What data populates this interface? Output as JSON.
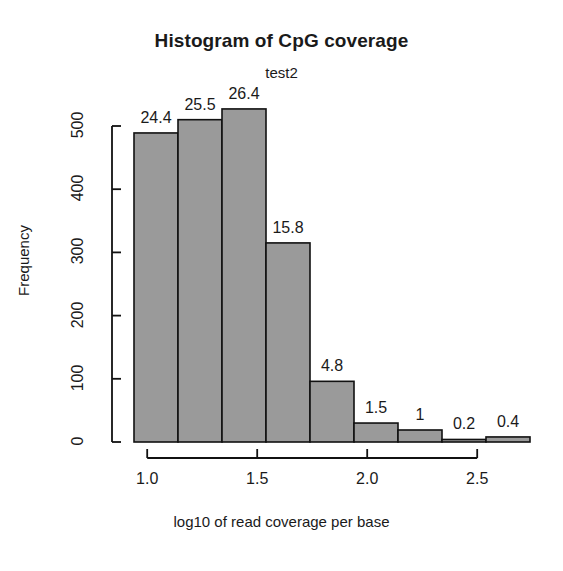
{
  "chart_data": {
    "type": "bar",
    "title": "Histogram of CpG coverage",
    "subtitle": "test2",
    "xlabel": "log10 of read coverage per base",
    "ylabel": "Frequency",
    "xlim": [
      0.94,
      2.74
    ],
    "ylim": [
      0,
      530
    ],
    "grid": false,
    "legend": "none",
    "bin_width": 0.2,
    "x_ticks": [
      "1.0",
      "1.5",
      "2.0",
      "2.5"
    ],
    "x_tick_values": [
      1.0,
      1.5,
      2.0,
      2.5
    ],
    "y_ticks": [
      "0",
      "100",
      "200",
      "300",
      "400",
      "500"
    ],
    "y_tick_values": [
      0,
      100,
      200,
      300,
      400,
      500
    ],
    "bar_fill": "#9a9a9a",
    "bar_stroke": "#111111",
    "bins": [
      {
        "x_start": 0.94,
        "x_end": 1.14,
        "value": 489,
        "label": "24.4"
      },
      {
        "x_start": 1.14,
        "x_end": 1.34,
        "value": 510,
        "label": "25.5"
      },
      {
        "x_start": 1.34,
        "x_end": 1.54,
        "value": 527,
        "label": "26.4"
      },
      {
        "x_start": 1.54,
        "x_end": 1.74,
        "value": 315,
        "label": "15.8"
      },
      {
        "x_start": 1.74,
        "x_end": 1.94,
        "value": 96,
        "label": "4.8"
      },
      {
        "x_start": 1.94,
        "x_end": 2.14,
        "value": 30,
        "label": "1.5"
      },
      {
        "x_start": 2.14,
        "x_end": 2.34,
        "value": 19,
        "label": "1"
      },
      {
        "x_start": 2.34,
        "x_end": 2.54,
        "value": 4,
        "label": "0.2"
      },
      {
        "x_start": 2.54,
        "x_end": 2.74,
        "value": 8,
        "label": "0.4"
      }
    ],
    "categories": [
      "0.94-1.14",
      "1.14-1.34",
      "1.34-1.54",
      "1.54-1.74",
      "1.74-1.94",
      "1.94-2.14",
      "2.14-2.34",
      "2.34-2.54",
      "2.54-2.74"
    ],
    "values": [
      489,
      510,
      527,
      315,
      96,
      30,
      19,
      4,
      8
    ],
    "bar_labels": [
      "24.4",
      "25.5",
      "26.4",
      "15.8",
      "4.8",
      "1.5",
      "1",
      "0.2",
      "0.4"
    ]
  }
}
